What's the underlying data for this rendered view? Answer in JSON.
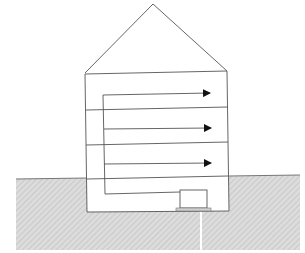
{
  "diagram": {
    "title": "",
    "colors": {
      "background": "#ffffff",
      "stroke": "#555555",
      "ground_fill": "#dcdcdc",
      "ground_hatch": "#c4c4c4",
      "arrow": "#111111"
    },
    "house": {
      "roof_apex": [
        153,
        4
      ],
      "roof_left": [
        85,
        73
      ],
      "roof_right": [
        227,
        71
      ],
      "walls": {
        "left": 86,
        "right": 228,
        "top": 73,
        "bottom": 211
      }
    },
    "floors": [
      {
        "name": "floor-1",
        "y_left": 110,
        "y_right": 107
      },
      {
        "name": "floor-2",
        "y_left": 145,
        "y_right": 142
      },
      {
        "name": "ground-level",
        "y_left": 179,
        "y_right": 176
      }
    ],
    "riser": {
      "x": 104,
      "y_top": 95,
      "y_bottom": 193
    },
    "arrows": [
      {
        "name": "arrow-top-floor",
        "y_start": 95,
        "y_end": 93,
        "x_end": 208
      },
      {
        "name": "arrow-middle-floor",
        "y_start": 129,
        "y_end": 128,
        "x_end": 209
      },
      {
        "name": "arrow-lower-floor",
        "y_start": 164,
        "y_end": 163,
        "x_end": 209
      }
    ],
    "duct": {
      "x_start": 104,
      "x_end": 180,
      "y_start": 193,
      "y_end": 192
    },
    "furnace": {
      "x": 180,
      "y": 190,
      "w": 27,
      "h": 18,
      "base_x": 176,
      "base_y": 208,
      "base_w": 35,
      "base_h": 3
    },
    "ground": {
      "x": 16,
      "y": 178,
      "w": 284,
      "h": 72,
      "gap_x": 200,
      "gap_w": 2
    }
  }
}
